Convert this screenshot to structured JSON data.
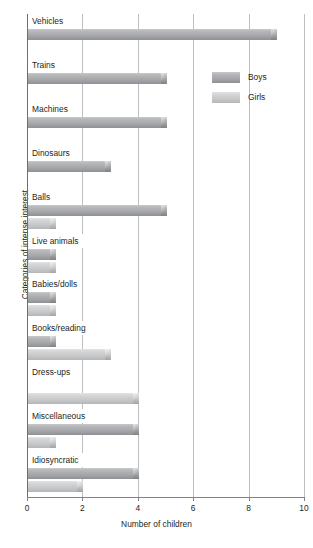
{
  "chart_data": {
    "type": "bar",
    "orientation": "horizontal",
    "title": "",
    "xlabel": "Number of children",
    "ylabel": "Categories of intense interest",
    "xlim": [
      0,
      10
    ],
    "xticks": [
      0,
      2,
      4,
      6,
      8,
      10
    ],
    "grid": true,
    "legend_position": "upper right",
    "categories": [
      "Vehicles",
      "Trains",
      "Machines",
      "Dinosaurs",
      "Balls",
      "Live animals",
      "Babies/dolls",
      "Books/reading",
      "Dress-ups",
      "Miscellaneous",
      "Idiosyncratic"
    ],
    "series": [
      {
        "name": "Boys",
        "color": "#a7a9ac",
        "values": [
          9,
          5,
          5,
          3,
          5,
          1,
          1,
          1,
          0,
          4,
          4
        ]
      },
      {
        "name": "Girls",
        "color": "#c8cacb",
        "values": [
          0,
          0,
          0,
          0,
          1,
          1,
          1,
          3,
          4,
          1,
          2
        ]
      }
    ]
  },
  "legend": {
    "items": [
      {
        "label": "Boys"
      },
      {
        "label": "Girls"
      }
    ]
  }
}
